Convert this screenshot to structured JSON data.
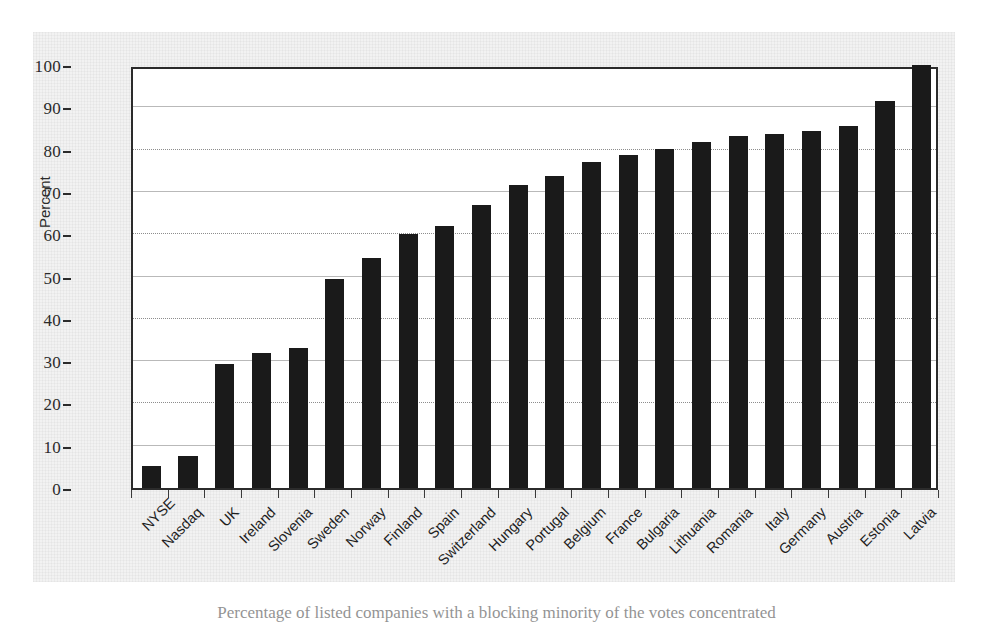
{
  "figure": {
    "caption": "Percentage of listed companies with a blocking minority of the votes concentrated"
  },
  "chart_data": {
    "type": "bar",
    "title": "",
    "subtitle": "",
    "xlabel": "",
    "ylabel": "Percent",
    "ylim": [
      0,
      100
    ],
    "ytick_step": 10,
    "yticks": [
      0,
      10,
      20,
      30,
      40,
      50,
      60,
      70,
      80,
      90,
      100
    ],
    "ytick_labels": [
      "0",
      "10",
      "20",
      "30",
      "40",
      "50",
      "60",
      "70",
      "80",
      "90",
      "100"
    ],
    "grid": true,
    "legend": false,
    "legend_position": "none",
    "bar_color": "#1a1a1a",
    "categories": [
      "NYSE",
      "Nasdaq",
      "UK",
      "Ireland",
      "Slovenia",
      "Sweden",
      "Norway",
      "Finland",
      "Spain",
      "Switzerland",
      "Hungary",
      "Portugal",
      "Belgium",
      "France",
      "Bulgaria",
      "Lithuania",
      "Romania",
      "Italy",
      "Germany",
      "Austria",
      "Estonia",
      "Latvia"
    ],
    "values": [
      5.2,
      7.6,
      29.2,
      32.0,
      33.1,
      49.5,
      54.3,
      60.0,
      61.9,
      66.9,
      71.6,
      73.8,
      77.0,
      78.7,
      80.1,
      81.8,
      83.2,
      83.6,
      84.3,
      85.5,
      91.6,
      100.0
    ]
  }
}
